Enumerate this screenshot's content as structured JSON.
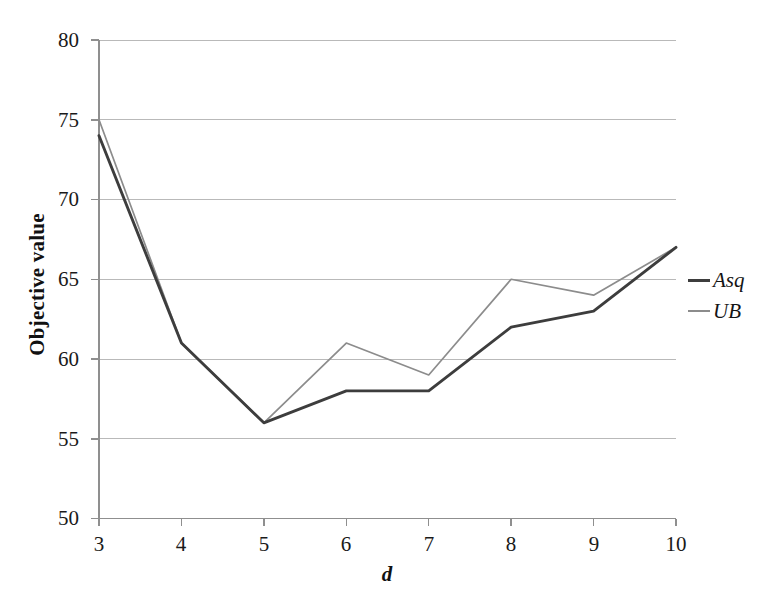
{
  "chart_data": {
    "type": "line",
    "title": "",
    "xlabel": "d",
    "ylabel": "Objective value",
    "x": [
      3,
      4,
      5,
      6,
      7,
      8,
      9,
      10
    ],
    "xtick_labels": [
      "3",
      "4",
      "5",
      "6",
      "7",
      "8",
      "9",
      "10"
    ],
    "ytick_labels": [
      "50",
      "55",
      "60",
      "65",
      "70",
      "75",
      "80"
    ],
    "ytick_values": [
      50,
      55,
      60,
      65,
      70,
      75,
      80
    ],
    "xlim": [
      3,
      10
    ],
    "ylim": [
      50,
      80
    ],
    "grid": "horizontal",
    "legend_position": "right",
    "series": [
      {
        "name": "Asq",
        "color": "#3d3d3d",
        "values": [
          74,
          61,
          56,
          58,
          58,
          62,
          63,
          67
        ]
      },
      {
        "name": "UB",
        "color": "#8c8c8c",
        "values": [
          75,
          61,
          56,
          61,
          59,
          65,
          64,
          67
        ]
      }
    ]
  },
  "axes": {
    "y_title": "Objective value",
    "x_title": "d",
    "y_ticks": [
      "80",
      "75",
      "70",
      "65",
      "60",
      "55",
      "50"
    ],
    "x_ticks": [
      "3",
      "4",
      "5",
      "6",
      "7",
      "8",
      "9",
      "10"
    ]
  },
  "legend": {
    "items": [
      {
        "label": "Asq",
        "color": "#3d3d3d"
      },
      {
        "label": "UB",
        "color": "#8c8c8c"
      }
    ]
  },
  "colors": {
    "background": "#ffffff",
    "axis": "#8f8f8f",
    "grid": "#b9b9b9",
    "series_asq": "#3d3d3d",
    "series_ub": "#8c8c8c"
  }
}
